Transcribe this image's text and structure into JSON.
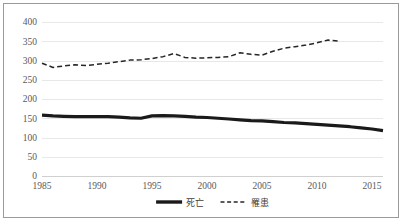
{
  "chart_data": {
    "type": "line",
    "title": "",
    "subtitle": "",
    "xlabel": "",
    "ylabel": "",
    "xlim": [
      1985,
      2016
    ],
    "ylim": [
      0,
      400
    ],
    "grid": true,
    "grid_axis": "y",
    "legend_position": "bottom",
    "y_ticks": [
      0,
      50,
      100,
      150,
      200,
      250,
      300,
      350,
      400
    ],
    "y_tick_labels": [
      "0",
      "50",
      "100",
      "150",
      "200",
      "250",
      "300",
      "350",
      "400"
    ],
    "x_ticks": [
      1985,
      1990,
      1995,
      2000,
      2005,
      2010,
      2015
    ],
    "x_tick_labels": [
      "1985",
      "1990",
      "1995",
      "2000",
      "2005",
      "2010",
      "2015"
    ],
    "x": [
      1985,
      1986,
      1987,
      1988,
      1989,
      1990,
      1991,
      1992,
      1993,
      1994,
      1995,
      1996,
      1997,
      1998,
      1999,
      2000,
      2001,
      2002,
      2003,
      2004,
      2005,
      2006,
      2007,
      2008,
      2009,
      2010,
      2011,
      2012,
      2013,
      2014,
      2015,
      2016
    ],
    "series": [
      {
        "name": "死亡",
        "style": "solid",
        "color": "#1a1a1a",
        "x": [
          1985,
          1986,
          1987,
          1988,
          1989,
          1990,
          1991,
          1992,
          1993,
          1994,
          1995,
          1996,
          1997,
          1998,
          1999,
          2000,
          2001,
          2002,
          2003,
          2004,
          2005,
          2006,
          2007,
          2008,
          2009,
          2010,
          2011,
          2012,
          2013,
          2014,
          2015,
          2016
        ],
        "values": [
          158,
          156,
          155,
          154,
          154,
          154,
          154,
          153,
          151,
          150,
          156,
          157,
          156,
          155,
          153,
          152,
          150,
          148,
          146,
          144,
          143,
          141,
          139,
          138,
          136,
          134,
          132,
          130,
          128,
          125,
          122,
          118
        ]
      },
      {
        "name": "罹患",
        "style": "dashed",
        "color": "#262626",
        "x": [
          1985,
          1986,
          1987,
          1988,
          1989,
          1990,
          1991,
          1992,
          1993,
          1994,
          1995,
          1996,
          1997,
          1998,
          1999,
          2000,
          2001,
          2002,
          2003,
          2004,
          2005,
          2006,
          2007,
          2008,
          2009,
          2010,
          2011,
          2012
        ],
        "values": [
          293,
          282,
          286,
          289,
          287,
          290,
          293,
          297,
          301,
          302,
          305,
          310,
          318,
          308,
          306,
          307,
          308,
          310,
          320,
          316,
          314,
          324,
          332,
          336,
          340,
          346,
          353,
          350
        ]
      }
    ],
    "legend": [
      {
        "label": "死亡",
        "style": "solid"
      },
      {
        "label": "罹患",
        "style": "dashed"
      }
    ]
  }
}
